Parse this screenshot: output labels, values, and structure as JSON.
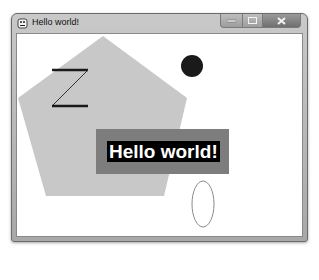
{
  "window": {
    "title": "Hello world!",
    "icon": "app-icon",
    "controls": {
      "minimize": "minimize-icon",
      "maximize": "maximize-icon",
      "close": "close-icon"
    }
  },
  "canvas": {
    "background": "#ffffff",
    "pentagon": {
      "fill": "#c8c8c8",
      "points": "86,2 170,64 147,162 29,162 1,64"
    },
    "z_shape": {
      "stroke": "#1a1a1a"
    },
    "circle": {
      "fill": "#1a1a1a",
      "cx": 175,
      "cy": 32,
      "r": 11
    },
    "ellipse": {
      "stroke": "#8a8a8a",
      "cx": 186,
      "cy": 170,
      "rx": 11,
      "ry": 23
    },
    "banner": {
      "background": "#7d7d7d",
      "text": "Hello world!",
      "text_color": "#ffffff",
      "text_background": "#000000"
    }
  }
}
